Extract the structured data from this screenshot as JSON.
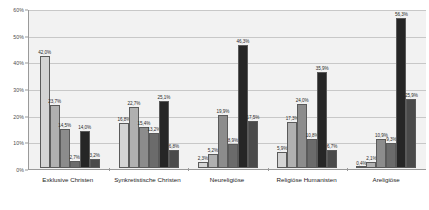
{
  "chart_data": {
    "type": "bar",
    "title": "",
    "subtitle": "",
    "xlabel": "",
    "ylabel": "",
    "ylim": [
      0,
      60
    ],
    "yticks": [
      "0%",
      "10%",
      "20%",
      "30%",
      "40%",
      "50%",
      "60%"
    ],
    "ytick_values": [
      0,
      10,
      20,
      30,
      40,
      50,
      60
    ],
    "grid": true,
    "legend": "none",
    "categories": [
      "Exklusive Christen",
      "Synkretistische Christen",
      "Neureligiöse",
      "Religiöse Humanisten",
      "Areligiöse"
    ],
    "series": [
      {
        "name": "series-1",
        "color": "#d4d4d4",
        "values": [
          42.0,
          16.8,
          2.3,
          5.9,
          0.4
        ],
        "labels": [
          "42,0%",
          "16,8%",
          "2,3%",
          "5,9%",
          "0,4%"
        ]
      },
      {
        "name": "series-2",
        "color": "#b0b0b0",
        "values": [
          23.7,
          22.7,
          5.2,
          17.3,
          2.1
        ],
        "labels": [
          "23,7%",
          "22,7%",
          "5,2%",
          "17,3%",
          "2,1%"
        ]
      },
      {
        "name": "series-3",
        "color": "#8c8c8c",
        "values": [
          14.5,
          15.4,
          19.9,
          24.0,
          10.9
        ],
        "labels": [
          "14,5%",
          "15,4%",
          "19,9%",
          "24,0%",
          "10,9%"
        ]
      },
      {
        "name": "series-4",
        "color": "#6b6b6b",
        "values": [
          2.7,
          13.2,
          8.9,
          10.8,
          9.3
        ],
        "labels": [
          "2,7%",
          "13,2%",
          "8,9%",
          "10,8%",
          "9,3%"
        ]
      },
      {
        "name": "series-5",
        "color": "#262626",
        "values": [
          14.0,
          25.1,
          46.3,
          35.9,
          56.3
        ],
        "labels": [
          "14,0%",
          "25,1%",
          "46,3%",
          "35,9%",
          "56,3%"
        ]
      },
      {
        "name": "series-6",
        "color": "#4a4a4a",
        "values": [
          3.2,
          6.8,
          17.5,
          6.7,
          25.9
        ],
        "labels": [
          "3,2%",
          "6,8%",
          "17,5%",
          "6,7%",
          "25,9%"
        ]
      }
    ],
    "colors": {
      "plot_background": "#f2f2f2",
      "gridline": "#c8c8c8",
      "axis": "#9a9a9a",
      "page_background": "#ffffff",
      "label_text": "#2b2b2b"
    }
  }
}
